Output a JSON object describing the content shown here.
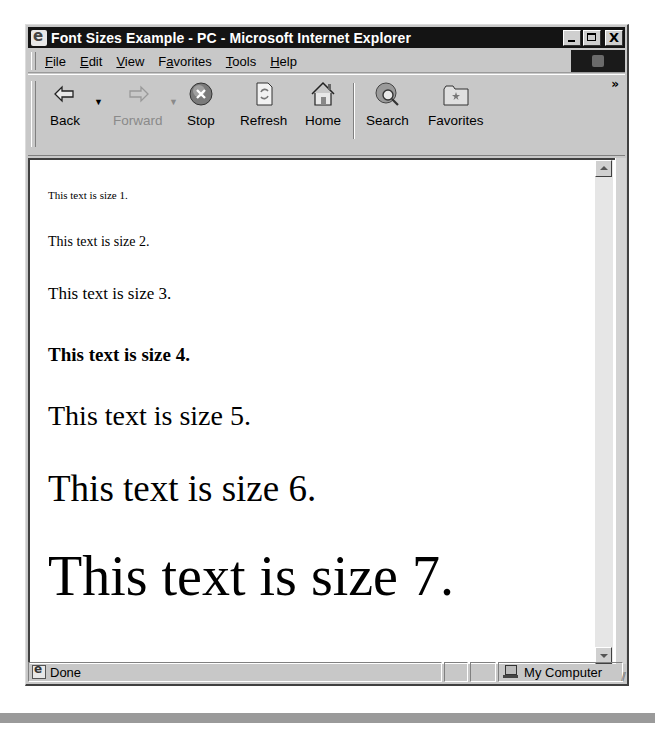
{
  "window": {
    "title": "Font Sizes Example - PC - Microsoft Internet Explorer",
    "controls": {
      "minimize": "_",
      "maximize": "□",
      "close": "X"
    }
  },
  "menubar": {
    "items": [
      {
        "label": "File",
        "accel": "F",
        "rest": "ile"
      },
      {
        "label": "Edit",
        "accel": "E",
        "rest": "dit"
      },
      {
        "label": "View",
        "accel": "V",
        "rest": "iew"
      },
      {
        "label": "Favorites",
        "pre": "F",
        "accel": "a",
        "rest": "vorites"
      },
      {
        "label": "Tools",
        "accel": "T",
        "rest": "ools"
      },
      {
        "label": "Help",
        "accel": "H",
        "rest": "elp"
      }
    ]
  },
  "toolbar": {
    "buttons": [
      {
        "label": "Back",
        "icon": "back-arrow-icon",
        "enabled": true
      },
      {
        "label": "Forward",
        "icon": "forward-arrow-icon",
        "enabled": false
      },
      {
        "label": "Stop",
        "icon": "stop-icon",
        "enabled": true
      },
      {
        "label": "Refresh",
        "icon": "refresh-icon",
        "enabled": true
      },
      {
        "label": "Home",
        "icon": "home-icon",
        "enabled": true
      },
      {
        "label": "Search",
        "icon": "search-icon",
        "enabled": true
      },
      {
        "label": "Favorites",
        "icon": "favorites-folder-icon",
        "enabled": true
      }
    ],
    "more": "»"
  },
  "content": {
    "lines": [
      {
        "text": "This text is size 1.",
        "size": 1,
        "bold": false
      },
      {
        "text": "This text is size 2.",
        "size": 2,
        "bold": false
      },
      {
        "text": "This text is size 3.",
        "size": 3,
        "bold": false
      },
      {
        "text": "This text is size 4.",
        "size": 4,
        "bold": true
      },
      {
        "text": "This text is size 5.",
        "size": 5,
        "bold": false
      },
      {
        "text": "This text is size 6.",
        "size": 6,
        "bold": false
      },
      {
        "text": "This text is size 7.",
        "size": 7,
        "bold": false
      }
    ]
  },
  "statusbar": {
    "status": "Done",
    "zone": "My Computer"
  }
}
